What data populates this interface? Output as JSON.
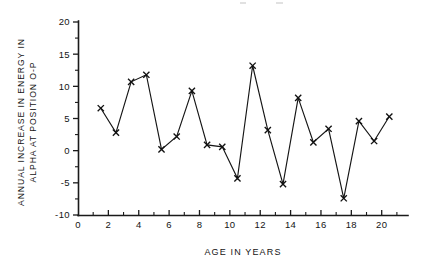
{
  "chart_data": {
    "type": "line",
    "title": "",
    "subtitle": "",
    "xlabel": "AGE IN YEARS",
    "ylabel_line1": "ANNUAL INCREASE IN ENERGY IN",
    "ylabel_line2": "ALPHA AT POSITION O-P",
    "xlim": [
      0,
      21.6
    ],
    "ylim": [
      -10,
      20
    ],
    "grid": false,
    "legend": "none",
    "marker": "x",
    "x_major_ticks": [
      0,
      2,
      4,
      6,
      8,
      10,
      12,
      14,
      16,
      18,
      20
    ],
    "x_minor_ticks": [
      1,
      3,
      5,
      7,
      9,
      11,
      13,
      15,
      17,
      19,
      21
    ],
    "x_tick_labels": [
      "0",
      "2",
      "4",
      "6",
      "8",
      "10",
      "12",
      "14",
      "16",
      "18",
      "20"
    ],
    "y_major_ticks": [
      -10,
      -5,
      0,
      5,
      10,
      15,
      20
    ],
    "y_minor_ticks": [
      -7.5,
      -2.5,
      2.5,
      7.5,
      12.5,
      17.5
    ],
    "y_tick_labels": [
      "-10",
      "-5",
      "0",
      "5",
      "10",
      "15",
      "20"
    ],
    "x": [
      1.5,
      2.5,
      3.5,
      4.5,
      5.5,
      6.5,
      7.5,
      8.5,
      9.5,
      10.5,
      11.5,
      12.5,
      13.5,
      14.5,
      15.5,
      16.5,
      17.5,
      18.5,
      19.5,
      20.5
    ],
    "values": [
      6.6,
      2.8,
      10.7,
      11.8,
      0.2,
      2.2,
      9.3,
      0.9,
      0.6,
      -4.3,
      13.2,
      3.2,
      -5.2,
      8.2,
      1.3,
      3.4,
      -7.4,
      4.6,
      1.5,
      5.3
    ],
    "series": [
      {
        "name": "Annual increase in energy in alpha at position O-P",
        "values": [
          6.6,
          2.8,
          10.7,
          11.8,
          0.2,
          2.2,
          9.3,
          0.9,
          0.6,
          -4.3,
          13.2,
          3.2,
          -5.2,
          8.2,
          1.3,
          3.4,
          -7.4,
          4.6,
          1.5,
          5.3
        ]
      }
    ],
    "line_color": "#151515",
    "marker_color": "#111111",
    "axis_color": "#1a1a1a",
    "background_color": "#ffffff"
  },
  "figure": {
    "plot_left_px": 78,
    "plot_right_px": 406,
    "plot_top_px": 22,
    "plot_bottom_px": 215
  }
}
